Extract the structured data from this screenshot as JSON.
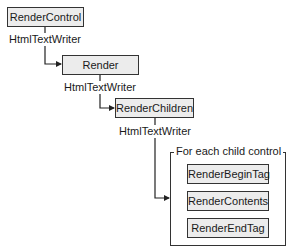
{
  "diagram": {
    "nodes": {
      "render_control": "RenderControl",
      "render": "Render",
      "render_children": "RenderChildren",
      "render_begin_tag": "RenderBeginTag",
      "render_contents": "RenderContents",
      "render_end_tag": "RenderEndTag"
    },
    "edge_labels": {
      "writer_1": "HtmlTextWriter",
      "writer_2": "HtmlTextWriter",
      "writer_3": "HtmlTextWriter"
    },
    "group": {
      "title": "For each child control"
    },
    "colors": {
      "box_fill": "#ececec",
      "stroke": "#333333",
      "background": "#ffffff"
    }
  }
}
